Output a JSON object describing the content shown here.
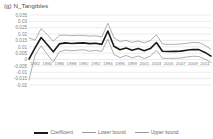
{
  "chart_data": {
    "type": "line",
    "title": "(g) N_Tangibles",
    "xlabel": "",
    "ylabel": "",
    "ylim": [
      -0.02,
      0.035
    ],
    "grid": true,
    "legend_position": "bottom",
    "yticks": [
      "0.035",
      "0.03",
      "0.025",
      "0.02",
      "0.015",
      "0.01",
      "0.005",
      "0",
      "-0.005",
      "-0.01",
      "-0.015",
      "-0.02"
    ],
    "ytick_values": [
      0.035,
      0.03,
      0.025,
      0.02,
      0.015,
      0.01,
      0.005,
      0,
      -0.005,
      -0.01,
      -0.015,
      -0.02
    ],
    "xticks": [
      "1982",
      "1984",
      "1986",
      "1988",
      "1990",
      "1992",
      "1994",
      "1996",
      "1999",
      "2001",
      "2003",
      "2005",
      "2007",
      "2009",
      "2011"
    ],
    "x": [
      1982,
      1983,
      1984,
      1985,
      1986,
      1987,
      1988,
      1989,
      1990,
      1991,
      1992,
      1993,
      1994,
      1995,
      1996,
      1997,
      1998,
      1999,
      2000,
      2001,
      2002,
      2003,
      2004,
      2005,
      2006,
      2007,
      2008,
      2009,
      2010,
      2011,
      2012
    ],
    "series": [
      {
        "name": "Coefficient",
        "color": "#1a1a1a",
        "width": 1.6,
        "values": [
          0.0003,
          0.0092,
          0.0173,
          0.0118,
          0.0061,
          0.0123,
          0.0131,
          0.0126,
          0.0129,
          0.0131,
          0.0125,
          0.0128,
          0.0119,
          0.0224,
          0.0104,
          0.0077,
          0.009,
          0.0073,
          0.0086,
          0.0069,
          0.0086,
          0.0134,
          0.0065,
          0.0063,
          0.0064,
          0.0066,
          0.0073,
          0.0079,
          0.0078,
          0.0056,
          0.0027
        ]
      },
      {
        "name": "Lower bound",
        "color": "#9a9a9a",
        "width": 0.8,
        "values": [
          -0.016,
          0.0035,
          0.0108,
          0.0041,
          -0.0019,
          0.006,
          0.0075,
          0.0069,
          0.0073,
          0.0077,
          0.0066,
          0.0072,
          0.0064,
          0.016,
          0.004,
          0.0015,
          0.0032,
          0.0013,
          0.0028,
          0.0008,
          0.0027,
          0.0072,
          0.0011,
          0.0009,
          0.001,
          0.0012,
          0.002,
          0.0026,
          0.0024,
          0.0003,
          -0.0023
        ]
      },
      {
        "name": "Upper bound",
        "color": "#9a9a9a",
        "width": 0.8,
        "values": [
          0.017,
          0.0152,
          0.0243,
          0.0197,
          0.0143,
          0.019,
          0.0192,
          0.0188,
          0.019,
          0.0189,
          0.0184,
          0.0186,
          0.0177,
          0.0285,
          0.0172,
          0.0142,
          0.0151,
          0.0135,
          0.0146,
          0.0132,
          0.0148,
          0.0195,
          0.0122,
          0.0119,
          0.012,
          0.0122,
          0.0128,
          0.0134,
          0.0133,
          0.0112,
          0.008
        ]
      }
    ]
  },
  "legend": {
    "items": [
      {
        "label": "Coefficient",
        "style": "coef"
      },
      {
        "label": "Lower bound",
        "style": "bound"
      },
      {
        "label": "Upper bound",
        "style": "bound"
      }
    ]
  },
  "colors": {
    "coefficient": "#1a1a1a",
    "bounds": "#9a9a9a",
    "gridline": "#d9d9d9",
    "tick_text": "#7f7f7f",
    "title_text": "#4d4d4d",
    "background": "#ffffff"
  }
}
